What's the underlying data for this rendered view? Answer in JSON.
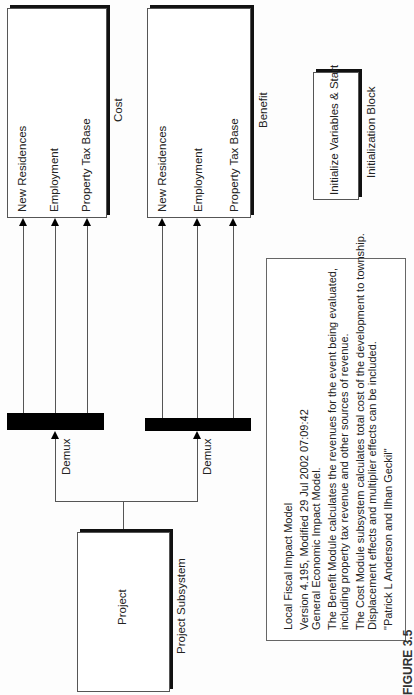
{
  "diagram": {
    "cost_block": {
      "inputs": [
        "New Residences",
        "Employment",
        "Property Tax Base"
      ],
      "label": "Cost"
    },
    "benefit_block": {
      "inputs": [
        "New Residences",
        "Employment",
        "Property Tax Base"
      ],
      "label": "Benefit"
    },
    "init_block": {
      "text": "Initialize Variables & Start",
      "label": "Initialization Block"
    },
    "demux": [
      {
        "label": "Demux"
      },
      {
        "label": "Demux"
      }
    ],
    "project_block": {
      "text": "Project",
      "label": "Project Subsystem"
    },
    "description": {
      "lines": [
        "Local Fiscal Impact Model",
        "Version 4.195, Modified 29 Jul 2002 07:09:42",
        "General Economic Impact Model.",
        "The Benefit Module calculates the revenues for the event being evaluated,",
        "   including property tax revenue and other sources of revenue.",
        "The Cost Module subsystem calculates total cost of the development to township.",
        "Displacement effects and multiplier effects can be included.",
        "\"Patrick L Anderson and Ilhan Geckil\""
      ]
    },
    "caption": "FIGURE 3.5"
  }
}
